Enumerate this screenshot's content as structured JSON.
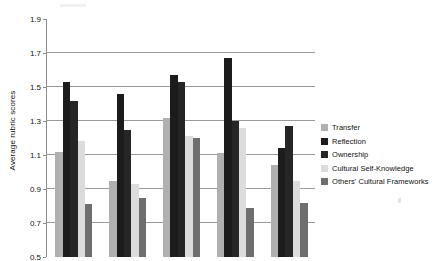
{
  "chart_data": {
    "type": "bar",
    "title": "",
    "subtitle": "",
    "xlabel": "",
    "ylabel": "Average rubric scores",
    "ylim": [
      0.5,
      1.9
    ],
    "ytick_labels": [
      "0.5",
      "0.7",
      "0.9",
      "1.1",
      "1.3",
      "1.5",
      "1.7",
      "1.9"
    ],
    "ytick_values": [
      0.5,
      0.7,
      0.9,
      1.1,
      1.3,
      1.5,
      1.7,
      1.9
    ],
    "grid": true,
    "grid_axis": "y",
    "legend_position": "right",
    "categories": [
      "Group 1",
      "Group 2",
      "Group 3",
      "Group 4",
      "Group 5"
    ],
    "series": [
      {
        "name": "Transfer",
        "color": "#b0b0b0",
        "values": [
          1.12,
          0.95,
          1.32,
          1.11,
          1.04
        ]
      },
      {
        "name": "Reflection",
        "color": "#1c1c1c",
        "values": [
          1.53,
          1.46,
          1.57,
          1.67,
          1.14
        ]
      },
      {
        "name": "Ownership",
        "color": "#262626",
        "values": [
          1.42,
          1.25,
          1.53,
          1.3,
          1.27
        ]
      },
      {
        "name": "Cultural Self-Knowledge",
        "color": "#dcdcdc",
        "values": [
          1.18,
          0.93,
          1.21,
          1.26,
          0.95
        ]
      },
      {
        "name": "Others' Cultural Frameworks",
        "color": "#6e6e6e",
        "values": [
          0.81,
          0.85,
          1.2,
          0.79,
          0.82
        ]
      }
    ]
  },
  "legend": {
    "items": [
      {
        "label": "Transfer",
        "color": "#b0b0b0"
      },
      {
        "label": "Reflection",
        "color": "#1c1c1c"
      },
      {
        "label": "Ownership",
        "color": "#262626"
      },
      {
        "label": "Cultural Self-Knowledge",
        "color": "#dcdcdc"
      },
      {
        "label": "Others' Cultural Frameworks",
        "color": "#6e6e6e"
      }
    ]
  },
  "axis": {
    "y_title": "Average rubric scores"
  }
}
